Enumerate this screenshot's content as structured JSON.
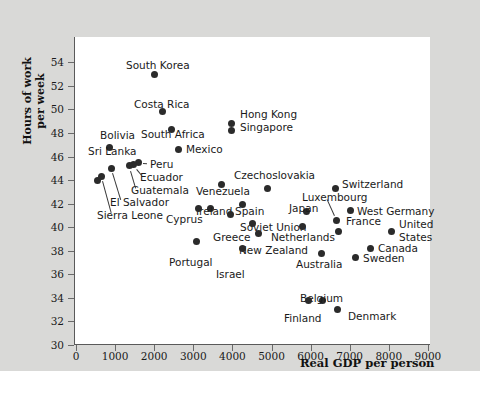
{
  "chart_data": {
    "type": "scatter",
    "title": "",
    "xlabel": "Real GDP per person",
    "ylabel": "Hours of work per week",
    "xlim": [
      0,
      9500
    ],
    "ylim": [
      30,
      55
    ],
    "xticks": [
      0,
      1000,
      2000,
      3000,
      4000,
      5000,
      6000,
      7000,
      8000,
      9000
    ],
    "yticks": [
      30,
      32,
      34,
      36,
      38,
      40,
      42,
      44,
      46,
      48,
      50,
      52,
      54
    ],
    "grid": false,
    "legend": "none",
    "point_color": "#2b2b2b",
    "background_color": "#d9d9d7",
    "plot_background_color": "#ffffff",
    "points": [
      {
        "name": "South Korea",
        "x": 2020,
        "y": 53.0,
        "lx": 126,
        "ly": 60,
        "anchor": "left"
      },
      {
        "name": "Costa Rica",
        "x": 2200,
        "y": 49.8,
        "lx": 134,
        "ly": 99,
        "anchor": "left"
      },
      {
        "name": "South Africa",
        "x": 2430,
        "y": 48.3,
        "lx": 141,
        "ly": 129,
        "anchor": "left"
      },
      {
        "name": "Mexico",
        "x": 2610,
        "y": 46.6,
        "lx": 186,
        "ly": 144,
        "anchor": "left"
      },
      {
        "name": "Hong Kong",
        "x": 3970,
        "y": 48.8,
        "lx": 240,
        "ly": 109,
        "anchor": "left"
      },
      {
        "name": "Singapore",
        "x": 3970,
        "y": 48.2,
        "lx": 240,
        "ly": 122,
        "anchor": "left"
      },
      {
        "name": "Bolivia",
        "x": 860,
        "y": 46.8,
        "lx": 100,
        "ly": 130,
        "anchor": "left"
      },
      {
        "name": "Sri Lanka",
        "x": 560,
        "y": 44.0,
        "lx": 88,
        "ly": 146,
        "anchor": "left"
      },
      {
        "name": "Peru",
        "x": 1590,
        "y": 45.5,
        "lx": 150,
        "ly": 159,
        "anchor": "left"
      },
      {
        "name": "Ecuador",
        "x": 1480,
        "y": 45.3,
        "lx": 140,
        "ly": 172,
        "anchor": "left"
      },
      {
        "name": "Guatemala",
        "x": 1360,
        "y": 45.2,
        "lx": 131,
        "ly": 185,
        "anchor": "left"
      },
      {
        "name": "El Salvador",
        "x": 920,
        "y": 45.0,
        "lx": 110,
        "ly": 197,
        "anchor": "left"
      },
      {
        "name": "Sierra Leone",
        "x": 660,
        "y": 44.3,
        "lx": 97,
        "ly": 210,
        "anchor": "left"
      },
      {
        "name": "Venezuela",
        "x": 3730,
        "y": 43.6,
        "lx": 196,
        "ly": 186,
        "anchor": "left"
      },
      {
        "name": "Czechoslovakia",
        "x": 4900,
        "y": 43.3,
        "lx": 234,
        "ly": 170,
        "anchor": "left"
      },
      {
        "name": "Ireland",
        "x": 3450,
        "y": 41.6,
        "lx": 196,
        "ly": 206,
        "anchor": "left"
      },
      {
        "name": "Spain",
        "x": 4270,
        "y": 41.9,
        "lx": 235,
        "ly": 206,
        "anchor": "left"
      },
      {
        "name": "Cyprus",
        "x": 3140,
        "y": 41.6,
        "lx": 166,
        "ly": 214,
        "anchor": "left"
      },
      {
        "name": "Soviet Union",
        "x": 3960,
        "y": 41.1,
        "lx": 240,
        "ly": 222,
        "anchor": "left"
      },
      {
        "name": "Greece",
        "x": 4520,
        "y": 40.3,
        "lx": 213,
        "ly": 232,
        "anchor": "left"
      },
      {
        "name": "New Zealand",
        "x": 4670,
        "y": 39.5,
        "lx": 239,
        "ly": 245,
        "anchor": "left"
      },
      {
        "name": "Netherlands",
        "x": 5800,
        "y": 40.1,
        "lx": 271,
        "ly": 232,
        "anchor": "left"
      },
      {
        "name": "Japan",
        "x": 5900,
        "y": 41.3,
        "lx": 289,
        "ly": 203,
        "anchor": "left"
      },
      {
        "name": "Luxembourg",
        "x": 6650,
        "y": 40.6,
        "lx": 302,
        "ly": 192,
        "anchor": "left"
      },
      {
        "name": "Switzerland",
        "x": 6640,
        "y": 43.3,
        "lx": 342,
        "ly": 179,
        "anchor": "left"
      },
      {
        "name": "West Germany",
        "x": 7020,
        "y": 41.4,
        "lx": 357,
        "ly": 206,
        "anchor": "left"
      },
      {
        "name": "France",
        "x": 6720,
        "y": 39.6,
        "lx": 346,
        "ly": 216,
        "anchor": "left"
      },
      {
        "name": "United",
        "x": 8080,
        "y": 39.6,
        "lx": 399,
        "ly": 219,
        "anchor": "left"
      },
      {
        "name": "States",
        "x": null,
        "y": null,
        "lx": 399,
        "ly": 232,
        "anchor": "left"
      },
      {
        "name": "Canada",
        "x": 7520,
        "y": 38.2,
        "lx": 378,
        "ly": 243,
        "anchor": "left"
      },
      {
        "name": "Sweden",
        "x": 7140,
        "y": 37.4,
        "lx": 363,
        "ly": 253,
        "anchor": "left"
      },
      {
        "name": "Australia",
        "x": 6290,
        "y": 37.8,
        "lx": 296,
        "ly": 259,
        "anchor": "left"
      },
      {
        "name": "Portugal",
        "x": 3070,
        "y": 38.8,
        "lx": 169,
        "ly": 257,
        "anchor": "left"
      },
      {
        "name": "Israel",
        "x": 4270,
        "y": 38.2,
        "lx": 216,
        "ly": 269,
        "anchor": "left"
      },
      {
        "name": "Belgium",
        "x": 6300,
        "y": 33.8,
        "lx": 300,
        "ly": 293,
        "anchor": "left"
      },
      {
        "name": "Finland",
        "x": 5940,
        "y": 33.8,
        "lx": 284,
        "ly": 313,
        "anchor": "left"
      },
      {
        "name": "Denmark",
        "x": 6700,
        "y": 33.0,
        "lx": 348,
        "ly": 311,
        "anchor": "left"
      }
    ]
  },
  "axes": {
    "y_label": "Hours of work per week",
    "y_label_line1": "Hours of work",
    "y_label_line2": "per week",
    "x_label": "Real GDP per person"
  }
}
